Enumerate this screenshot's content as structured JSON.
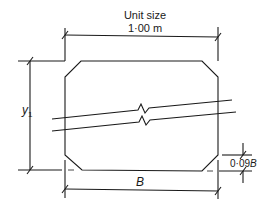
{
  "diagram": {
    "type": "precast box culvert unit cross-section",
    "colors": {
      "line": "#1a1a1a",
      "background": "#ffffff"
    },
    "labels": {
      "unit_size_title": "Unit size",
      "unit_size_value": "1·00 m",
      "height_symbol": "y",
      "height_subscript": "1",
      "width_symbol": "B",
      "chamfer_prefix": "0·09",
      "chamfer_symbol": "B"
    },
    "dimensions": [
      {
        "name": "unit-size",
        "text": "Unit size 1·00 m",
        "orientation": "horizontal"
      },
      {
        "name": "height",
        "text": "y1",
        "orientation": "vertical"
      },
      {
        "name": "width",
        "text": "B",
        "orientation": "horizontal"
      },
      {
        "name": "chamfer",
        "text": "0·09B",
        "orientation": "vertical"
      }
    ]
  }
}
